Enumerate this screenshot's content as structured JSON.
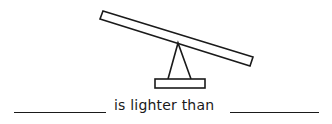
{
  "worksheet": {
    "illustration": {
      "name": "seesaw",
      "description": "Tilted seesaw: left end raised, right end lowered",
      "stroke_color": "#1a1a1a"
    },
    "sentence": {
      "blank_1": "",
      "phrase": "is lighter than",
      "blank_2": ""
    }
  }
}
